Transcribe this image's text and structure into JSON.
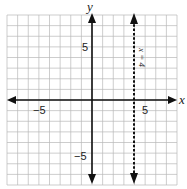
{
  "chart_data": {
    "type": "line",
    "title": "",
    "xlabel": "x",
    "ylabel": "y",
    "xlim": [
      -8,
      8
    ],
    "ylim": [
      -8,
      8
    ],
    "grid": true,
    "x_ticks_labeled": [
      -5,
      5
    ],
    "y_ticks_labeled": [
      5,
      -5
    ],
    "tick_labels": {
      "x_neg": "−5",
      "x_pos": "5",
      "y_pos": "5",
      "y_neg": "−5"
    },
    "series": [
      {
        "name": "x = 4",
        "style": "dashed",
        "equation": "x = 4",
        "x": [
          4,
          4
        ],
        "y": [
          -8,
          8
        ]
      }
    ],
    "annotations": [
      {
        "text": "x = 4",
        "x": 4.7,
        "y": 5.5,
        "rotation": 90
      }
    ]
  },
  "labels": {
    "x_axis": "x",
    "y_axis": "y",
    "line": "x = 4"
  }
}
